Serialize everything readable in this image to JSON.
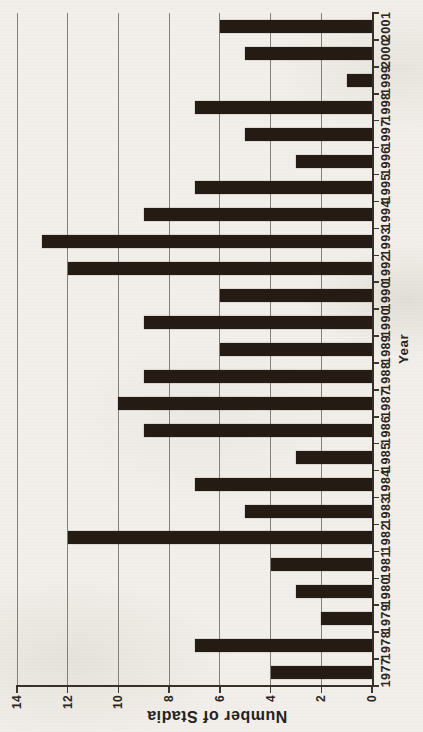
{
  "chart_data": {
    "type": "bar",
    "title": "",
    "xlabel": "Year",
    "ylabel": "Number of Stadia",
    "categories": [
      "1977",
      "1978",
      "1979",
      "1980",
      "1981",
      "1982",
      "1983",
      "1984",
      "1985",
      "1986",
      "1987",
      "1988",
      "1989",
      "1990",
      "1990",
      "1992",
      "1993",
      "1994",
      "1995",
      "1996",
      "1997",
      "1998",
      "1999",
      "2000",
      "2001"
    ],
    "values": [
      4,
      7,
      2,
      3,
      4,
      12,
      5,
      7,
      3,
      9,
      10,
      9,
      6,
      9,
      6,
      12,
      13,
      9,
      7,
      3,
      5,
      7,
      1,
      5,
      6
    ],
    "ylim": [
      0,
      14
    ],
    "ytick_labels": [
      "0",
      "2",
      "4",
      "6",
      "8",
      "10",
      "12",
      "14"
    ],
    "grid": "on",
    "legend": "none",
    "orientation_in_image": "chart rotated 90deg counterclockwise",
    "bar_color": "#241b14",
    "background_color": "#f2efea",
    "gridline_color": "#84817b",
    "axis_color": "#363028"
  }
}
